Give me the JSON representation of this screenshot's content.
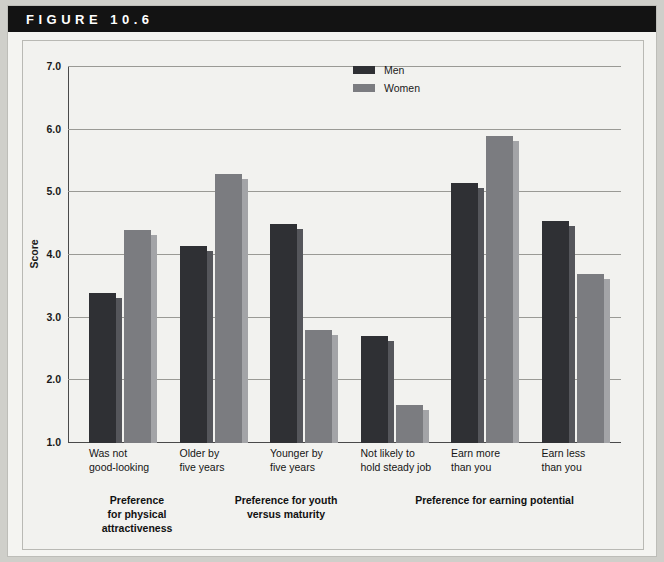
{
  "banner": {
    "figure_label": "FIGURE 10.6"
  },
  "legend": {
    "position": "top-right",
    "entries": [
      {
        "name": "Men",
        "color": "#2f3034"
      },
      {
        "name": "Women",
        "color": "#7b7c80"
      }
    ]
  },
  "group_captions": [
    "Preference\nfor physical\nattractiveness",
    "Preference for youth\nversus maturity",
    "Preference for earning potential"
  ],
  "chart_data": {
    "type": "bar",
    "title": "FIGURE 10.6",
    "xlabel": "",
    "ylabel": "Score",
    "ylim": [
      1.0,
      7.0
    ],
    "yticks": [
      "1.0",
      "2.0",
      "3.0",
      "4.0",
      "5.0",
      "6.0",
      "7.0"
    ],
    "ytick_values": [
      1.0,
      2.0,
      3.0,
      4.0,
      5.0,
      6.0,
      7.0
    ],
    "grid": "horizontal",
    "categories": [
      "Was not\ngood-looking",
      "Older by\nfive years",
      "Younger by\nfive years",
      "Not likely to\nhold steady job",
      "Earn more\nthan you",
      "Earn less\nthan you"
    ],
    "series": [
      {
        "name": "Men",
        "color": "#2f3034",
        "values": [
          3.4,
          4.15,
          4.5,
          2.7,
          5.15,
          4.55
        ]
      },
      {
        "name": "Women",
        "color": "#7b7c80",
        "values": [
          4.4,
          5.3,
          2.8,
          1.6,
          5.9,
          3.7
        ]
      }
    ]
  }
}
